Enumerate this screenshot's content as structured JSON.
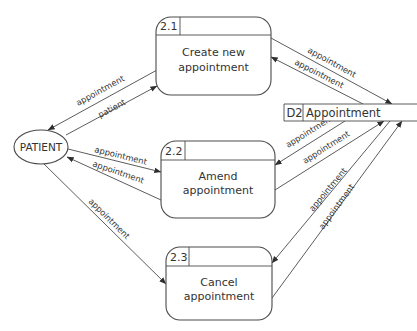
{
  "diagram": {
    "type": "data-flow-diagram",
    "external_entity": {
      "label": "PATIENT"
    },
    "data_store": {
      "id": "D2",
      "label": "Appointment"
    },
    "processes": [
      {
        "id": "2.1",
        "line1": "Create new",
        "line2": "appointment"
      },
      {
        "id": "2.2",
        "line1": "Amend",
        "line2": "appointment"
      },
      {
        "id": "2.3",
        "line1": "Cancel",
        "line2": "appointment"
      }
    ],
    "flows": [
      {
        "from": "2.1",
        "to": "PATIENT",
        "label": "appointment"
      },
      {
        "from": "PATIENT",
        "to": "2.1",
        "label": "patient"
      },
      {
        "from": "PATIENT",
        "to": "2.2",
        "label": "appointment"
      },
      {
        "from": "2.2",
        "to": "PATIENT",
        "label": "appointment"
      },
      {
        "from": "PATIENT",
        "to": "2.3",
        "label": "appointment"
      },
      {
        "from": "2.1",
        "to": "D2",
        "label": "appointment"
      },
      {
        "from": "D2",
        "to": "2.1",
        "label": "appointment"
      },
      {
        "from": "D2",
        "to": "2.2",
        "label": "appointment"
      },
      {
        "from": "2.2",
        "to": "D2",
        "label": "appointment"
      },
      {
        "from": "D2",
        "to": "2.3",
        "label": "appointment"
      },
      {
        "from": "2.3",
        "to": "D2",
        "label": "appointment"
      }
    ]
  },
  "colors": {
    "stroke": "#4a4a4a",
    "text": "#333333",
    "background": "#ffffff"
  }
}
